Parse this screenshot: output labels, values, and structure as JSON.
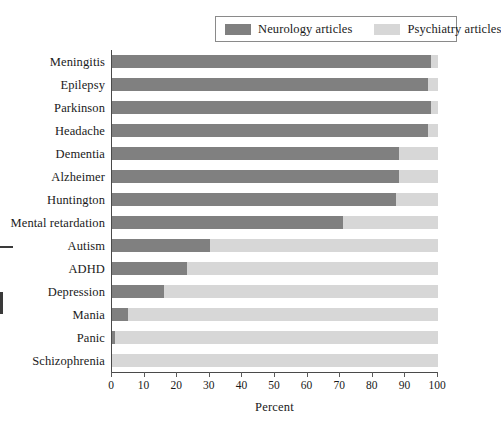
{
  "legend": {
    "entries": [
      {
        "label": "Neurology articles",
        "color": "#808080",
        "icon": "legend-swatch-icon"
      },
      {
        "label": "Psychiatry articles",
        "color": "#d7d7d7",
        "icon": "legend-swatch-icon"
      }
    ]
  },
  "axes": {
    "x_title": "Percent",
    "x_ticks": [
      "0",
      "10",
      "20",
      "30",
      "40",
      "50",
      "60",
      "70",
      "80",
      "90",
      "100"
    ]
  },
  "colors": {
    "neurology": "#808080",
    "psychiatry": "#d7d7d7",
    "axis": "#4a4a4a",
    "legend_border": "#8a8a8a",
    "text": "#1a1a1a"
  },
  "chart_data": {
    "type": "bar",
    "orientation": "horizontal",
    "stacked": true,
    "title": "",
    "xlabel": "Percent",
    "ylabel": "",
    "xlim": [
      0,
      100
    ],
    "grid": false,
    "legend_position": "top-right",
    "categories": [
      "Meningitis",
      "Epilepsy",
      "Parkinson",
      "Headache",
      "Dementia",
      "Alzheimer",
      "Huntington",
      "Mental retardation",
      "Autism",
      "ADHD",
      "Depression",
      "Mania",
      "Panic",
      "Schizophrenia"
    ],
    "series": [
      {
        "name": "Neurology articles",
        "color": "#808080",
        "values": [
          98,
          97,
          98,
          97,
          88,
          88,
          87,
          71,
          30,
          23,
          16,
          5,
          1,
          0
        ]
      },
      {
        "name": "Psychiatry articles",
        "color": "#d7d7d7",
        "values": [
          2,
          3,
          2,
          3,
          12,
          12,
          13,
          29,
          70,
          77,
          84,
          95,
          99,
          100
        ]
      }
    ]
  }
}
